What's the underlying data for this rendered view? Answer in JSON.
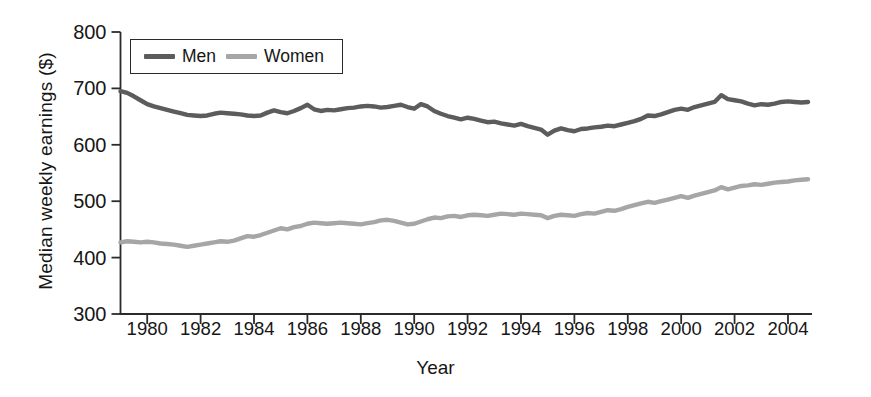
{
  "chart_data": {
    "type": "line",
    "title": "",
    "xlabel": "Year",
    "ylabel": "Median weekly earnings ($)",
    "xlim": [
      1979.0,
      2004.9
    ],
    "ylim": [
      300,
      800
    ],
    "yticks": [
      300,
      400,
      500,
      600,
      700,
      800
    ],
    "xticks": [
      1980,
      1982,
      1984,
      1986,
      1988,
      1990,
      1992,
      1994,
      1996,
      1998,
      2000,
      2002,
      2004
    ],
    "grid": false,
    "legend_position": "top-left-inside",
    "colors": {
      "men": "#5c5c5c",
      "women": "#a6a6a6",
      "axis": "#2b2b2b",
      "text": "#161616"
    },
    "x": [
      1979.0,
      1979.25,
      1979.5,
      1979.75,
      1980.0,
      1980.25,
      1980.5,
      1980.75,
      1981.0,
      1981.25,
      1981.5,
      1981.75,
      1982.0,
      1982.25,
      1982.5,
      1982.75,
      1983.0,
      1983.25,
      1983.5,
      1983.75,
      1984.0,
      1984.25,
      1984.5,
      1984.75,
      1985.0,
      1985.25,
      1985.5,
      1985.75,
      1986.0,
      1986.25,
      1986.5,
      1986.75,
      1987.0,
      1987.25,
      1987.5,
      1987.75,
      1988.0,
      1988.25,
      1988.5,
      1988.75,
      1989.0,
      1989.25,
      1989.5,
      1989.75,
      1990.0,
      1990.25,
      1990.5,
      1990.75,
      1991.0,
      1991.25,
      1991.5,
      1991.75,
      1992.0,
      1992.25,
      1992.5,
      1992.75,
      1993.0,
      1993.25,
      1993.5,
      1993.75,
      1994.0,
      1994.25,
      1994.5,
      1994.75,
      1995.0,
      1995.25,
      1995.5,
      1995.75,
      1996.0,
      1996.25,
      1996.5,
      1996.75,
      1997.0,
      1997.25,
      1997.5,
      1997.75,
      1998.0,
      1998.25,
      1998.5,
      1998.75,
      1999.0,
      1999.25,
      1999.5,
      1999.75,
      2000.0,
      2000.25,
      2000.5,
      2000.75,
      2001.0,
      2001.25,
      2001.5,
      2001.75,
      2002.0,
      2002.25,
      2002.5,
      2002.75,
      2003.0,
      2003.25,
      2003.5,
      2003.75,
      2004.0,
      2004.25,
      2004.5,
      2004.75
    ],
    "series": [
      {
        "name": "Men",
        "color": "#5c5c5c",
        "values": [
          695,
          692,
          686,
          679,
          672,
          668,
          665,
          662,
          659,
          656,
          653,
          652,
          651,
          652,
          655,
          657,
          656,
          655,
          654,
          652,
          651,
          652,
          657,
          661,
          658,
          656,
          660,
          665,
          671,
          663,
          660,
          662,
          661,
          663,
          665,
          666,
          668,
          669,
          668,
          666,
          667,
          669,
          671,
          667,
          664,
          672,
          668,
          660,
          655,
          651,
          648,
          645,
          648,
          646,
          643,
          640,
          641,
          638,
          636,
          634,
          637,
          633,
          630,
          627,
          618,
          625,
          629,
          626,
          624,
          628,
          629,
          631,
          632,
          634,
          633,
          636,
          639,
          642,
          646,
          652,
          651,
          654,
          658,
          662,
          664,
          662,
          667,
          670,
          673,
          676,
          688,
          681,
          679,
          677,
          673,
          670,
          672,
          671,
          673,
          676,
          677,
          676,
          675,
          676
        ]
      },
      {
        "name": "Women",
        "color": "#a6a6a6",
        "values": [
          427,
          429,
          428,
          427,
          428,
          427,
          425,
          424,
          423,
          421,
          419,
          421,
          423,
          425,
          427,
          429,
          428,
          430,
          434,
          438,
          437,
          440,
          444,
          448,
          452,
          450,
          454,
          456,
          460,
          462,
          461,
          460,
          461,
          462,
          461,
          460,
          459,
          461,
          463,
          466,
          467,
          465,
          462,
          459,
          460,
          464,
          468,
          471,
          470,
          473,
          474,
          472,
          475,
          476,
          475,
          474,
          476,
          478,
          477,
          476,
          478,
          477,
          476,
          475,
          470,
          474,
          476,
          475,
          474,
          477,
          479,
          478,
          481,
          484,
          483,
          486,
          490,
          493,
          496,
          499,
          497,
          500,
          503,
          506,
          509,
          506,
          510,
          513,
          516,
          519,
          525,
          521,
          524,
          527,
          528,
          530,
          529,
          531,
          533,
          534,
          535,
          537,
          538,
          539
        ]
      }
    ]
  },
  "legend": {
    "entries": [
      {
        "label": "Men"
      },
      {
        "label": "Women"
      }
    ]
  },
  "axes": {
    "y_title": "Median weekly earnings ($)",
    "x_title": "Year"
  }
}
